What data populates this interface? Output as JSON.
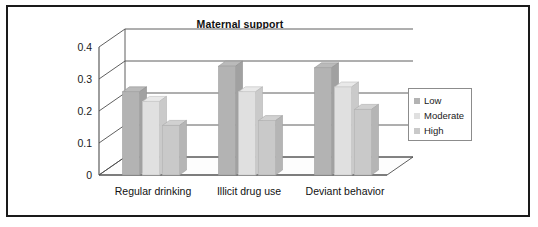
{
  "chart_data": {
    "type": "bar",
    "title": "Maternal support",
    "xlabel": "",
    "ylabel": "",
    "ylim": [
      0,
      0.4
    ],
    "yticks": [
      "0",
      "0.1",
      "0.2",
      "0.3",
      "0.4"
    ],
    "ytick_values": [
      0,
      0.1,
      0.2,
      0.3,
      0.4
    ],
    "grid": true,
    "legend_position": "right",
    "style": "3d-column",
    "categories": [
      "Regular drinking",
      "Illicit drug use",
      "Deviant behavior"
    ],
    "series": [
      {
        "name": "Low",
        "color": "#b3b3b3",
        "values": [
          0.26,
          0.34,
          0.335
        ]
      },
      {
        "name": "Moderate",
        "color": "#e0e0e0",
        "values": [
          0.23,
          0.26,
          0.275
        ]
      },
      {
        "name": "High",
        "color": "#c9c9c9",
        "values": [
          0.155,
          0.17,
          0.205
        ]
      }
    ]
  },
  "legend": {
    "items": [
      {
        "label": "Low",
        "color": "#b3b3b3"
      },
      {
        "label": "Moderate",
        "color": "#e0e0e0"
      },
      {
        "label": "High",
        "color": "#c9c9c9"
      }
    ]
  },
  "colors": {
    "frame_border": "#1a1a1a",
    "axis_line": "#4d4d4d",
    "gridline": "#4d4d4d",
    "floor": "#fdfdfd",
    "background": "#ffffff",
    "bar_low": "#b3b3b3",
    "bar_moderate": "#e0e0e0",
    "bar_high": "#c9c9c9"
  }
}
